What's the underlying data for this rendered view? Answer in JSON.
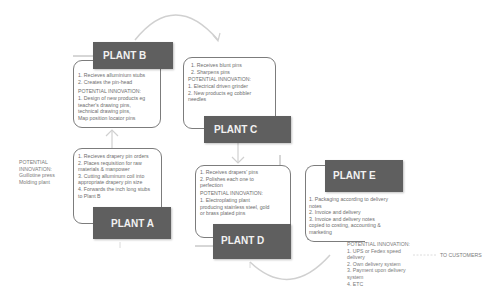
{
  "plants": {
    "b": {
      "title": "PLANT B",
      "steps": "1. Recieves alluminium stubs\n2. Creates the pin-head",
      "innovation_label": "POTENTIAL INNOVATION:",
      "innovation": "1. Design of new products eg\nteacher's drawing pins,\ntechnical drawing pins,\nMap position locator pins"
    },
    "c": {
      "title": "PLANT C",
      "steps": "1. Receives blunt pins\n2. Sharpens pins",
      "innovation_label": "POTENTIAL INNOVATION:",
      "innovation": "1. Electrical driven grinder\n2. New products eg cobbler\nneedles"
    },
    "a": {
      "title": "PLANT A",
      "steps": "1. Recieves drapery pin orders\n2. Places requisition for raw\nmaterials & manpower\n3. Cutting alluminum coil into\nappropriate drapery pin size\n4. Forwards the inch long stubs\nto Plant B"
    },
    "d": {
      "title": "PLANT D",
      "steps": "1. Receives drapers' pins\n2. Polishes each one to\nperfection",
      "innovation_label": "POTENTIAL INNOVATION:",
      "innovation": "1. Electroplating plant\nproducing stainless steel, gold\nor brass plated pins"
    },
    "e": {
      "title": "PLANT E",
      "steps": "1. Packaging according to delivery\nnotes\n2. Invoice and delivery\n3. Invoice and delivery notes\ncopied to costing, accounting &\nmarketing"
    }
  },
  "annotations": {
    "plant_a_innovation": "POTENTIAL\nINNOVATION:\nGuillotine press\nMolding plant",
    "plant_e_innovation": "POTENTIAL INNOVATION:\n1. UPS or Fedex speed\ndelivery\n2. Own delivery system\n3. Payment upon delivery\nsystem\n4. ETC",
    "to_customers": "TO CUSTOMERS"
  },
  "colors": {
    "header_bg": "#5f5f5f",
    "header_text": "#f2f2f2",
    "border": "#7c7c7c",
    "arrow": "#cfcfcf",
    "text": "#6e6e6e"
  }
}
